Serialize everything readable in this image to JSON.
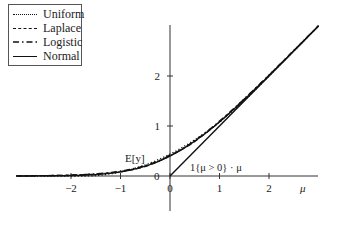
{
  "chart_data": {
    "type": "line",
    "title": "",
    "xlabel": "μ",
    "ylabel": "",
    "xlim": [
      -3.1,
      3.0
    ],
    "ylim": [
      -0.7,
      3.0
    ],
    "x_ticks": [
      -2,
      -1,
      0,
      1,
      2
    ],
    "x_tick_labels": [
      "−2",
      "−1",
      "0",
      "1",
      "2"
    ],
    "y_ticks": [
      0,
      1,
      2
    ],
    "y_tick_labels": [
      "0",
      "1",
      "2"
    ],
    "grid": false,
    "legend_position": "upper left",
    "annotations": [
      {
        "text": "E[y]",
        "x": -0.8,
        "y": 0.35
      },
      {
        "text": "1{μ > 0} · μ",
        "x": 0.45,
        "y": 0.12
      }
    ],
    "x": [
      -3.0,
      -2.5,
      -2.0,
      -1.5,
      -1.0,
      -0.5,
      0.0,
      0.5,
      1.0,
      1.5,
      2.0,
      2.5,
      3.0
    ],
    "series": [
      {
        "name": "Uniform",
        "style": "dotted",
        "values": [
          0.0,
          0.0,
          0.0,
          0.01,
          0.08,
          0.22,
          0.43,
          0.73,
          1.09,
          1.51,
          2.0,
          2.5,
          3.0
        ]
      },
      {
        "name": "Laplace",
        "style": "dashed",
        "values": [
          0.01,
          0.01,
          0.02,
          0.04,
          0.09,
          0.2,
          0.42,
          0.72,
          1.09,
          1.52,
          2.0,
          2.5,
          3.0
        ]
      },
      {
        "name": "Logistic",
        "style": "dashdot",
        "values": [
          0.01,
          0.01,
          0.02,
          0.04,
          0.09,
          0.2,
          0.41,
          0.71,
          1.08,
          1.52,
          2.01,
          2.5,
          3.0
        ]
      },
      {
        "name": "Normal",
        "style": "solid",
        "values": [
          0.0,
          0.0,
          0.01,
          0.03,
          0.08,
          0.2,
          0.4,
          0.7,
          1.08,
          1.53,
          2.01,
          2.5,
          3.0
        ]
      },
      {
        "name": "1{μ > 0} · μ",
        "style": "solid",
        "values": [
          0,
          0,
          0,
          0,
          0,
          0,
          0,
          0.5,
          1.0,
          1.5,
          2.0,
          2.5,
          3.0
        ]
      }
    ]
  },
  "legend": {
    "items": [
      {
        "label": "Uniform"
      },
      {
        "label": "Laplace"
      },
      {
        "label": "Logistic"
      },
      {
        "label": "Normal"
      }
    ]
  },
  "labels": {
    "expectation": "E[y]",
    "indicator": "1{μ > 0} · μ",
    "x_axis": "μ",
    "y_zero": "0"
  }
}
